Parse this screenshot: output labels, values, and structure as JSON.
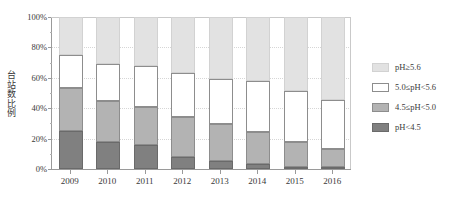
{
  "chart_data": {
    "type": "bar",
    "stacked": true,
    "stack_mode": "percent",
    "title": "",
    "subtitle": "",
    "xlabel": "",
    "ylabel": "台站数比例",
    "categories": [
      "2009",
      "2010",
      "2011",
      "2012",
      "2013",
      "2014",
      "2015",
      "2016"
    ],
    "ylim": [
      0,
      100
    ],
    "ytick_labels": [
      "0%",
      "20%",
      "40%",
      "60%",
      "80%",
      "100%"
    ],
    "ytick_values": [
      0,
      20,
      40,
      60,
      80,
      100
    ],
    "yminor_values": [
      10,
      30,
      50,
      70,
      90
    ],
    "grid": true,
    "grid_axis": "y",
    "legend_position": "right",
    "series": [
      {
        "name": "pH≥5.6",
        "key": "ge56",
        "color": "#e2e2e2",
        "edge_color": "#d2d2d2",
        "values": [
          25.0,
          31.0,
          32.0,
          37.0,
          40.5,
          42.0,
          49.0,
          54.5
        ]
      },
      {
        "name": "5.0≤pH<5.6",
        "key": "p50_56",
        "color": "#ffffff",
        "edge_color": "#8d8d8d",
        "values": [
          22.0,
          24.0,
          27.5,
          29.0,
          30.0,
          33.5,
          33.0,
          32.5
        ]
      },
      {
        "name": "4.5≤pH<5.0",
        "key": "p45_50",
        "color": "#b3b3b3",
        "edge_color": "#8d8d8d",
        "values": [
          28.0,
          27.0,
          25.0,
          26.0,
          24.0,
          21.5,
          16.5,
          11.5
        ]
      },
      {
        "name": "pH<4.5",
        "key": "lt45",
        "color": "#808080",
        "edge_color": "#6a6a6a",
        "values": [
          25.0,
          18.0,
          15.5,
          8.0,
          5.5,
          3.0,
          1.5,
          1.5
        ]
      }
    ],
    "stack_order_bottom_to_top": [
      "pH<4.5",
      "4.5≤pH<5.0",
      "5.0≤pH<5.6",
      "pH≥5.6"
    ]
  },
  "legend": {
    "items": [
      {
        "label": "pH≥5.6",
        "swatch": "#e2e2e2",
        "border": "#d2d2d2"
      },
      {
        "label": "5.0≤pH<5.6",
        "swatch": "#ffffff",
        "border": "#8d8d8d"
      },
      {
        "label": "4.5≤pH<5.0",
        "swatch": "#b3b3b3",
        "border": "#8d8d8d"
      },
      {
        "label": "pH<4.5",
        "swatch": "#808080",
        "border": "#6a6a6a"
      }
    ]
  },
  "colors": {
    "axis": "#9a9a9a",
    "grid": "#d6d6d6",
    "text": "#3a3a3a",
    "background": "#ffffff"
  }
}
